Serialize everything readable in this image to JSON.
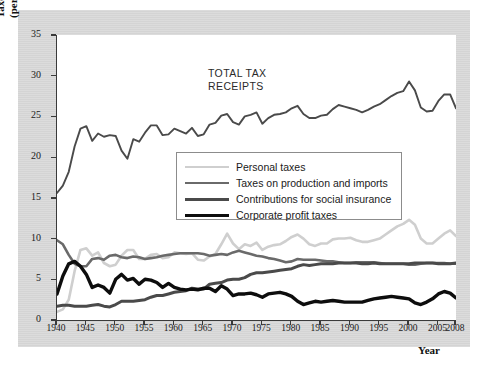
{
  "figure": {
    "annotation_line1": "TOTAL TAX",
    "annotation_line2": "RECEIPTS",
    "ylabel_line1": "Taxes",
    "ylabel_line2": "(percent of GDP)",
    "xlabel": "Year"
  },
  "legend": {
    "items": [
      {
        "label": "Personal taxes",
        "color": "#cfcfcf",
        "width": 2.6
      },
      {
        "label": "Taxes on production and imports",
        "color": "#6a6a6a",
        "width": 2.6
      },
      {
        "label": "Contributions for social insurance",
        "color": "#4a4a4a",
        "width": 3.0
      },
      {
        "label": "Corporate profit taxes",
        "color": "#0d0d0d",
        "width": 3.4
      }
    ]
  },
  "chart_data": {
    "type": "line",
    "title": "",
    "xlabel": "Year",
    "ylabel": "Taxes (percent of GDP)",
    "xlim": [
      1940,
      2008
    ],
    "ylim": [
      0,
      35
    ],
    "yticks": [
      0,
      5,
      10,
      15,
      20,
      25,
      30,
      35
    ],
    "xticks": [
      1940,
      1945,
      1950,
      1955,
      1960,
      1965,
      1970,
      1975,
      1980,
      1985,
      1990,
      1995,
      2000,
      2005,
      2008
    ],
    "grid": false,
    "legend_position": "center",
    "annotations": [
      {
        "text": "TOTAL TAX RECEIPTS",
        "x": 1966,
        "y": 31
      }
    ],
    "x": [
      1940,
      1941,
      1942,
      1943,
      1944,
      1945,
      1946,
      1947,
      1948,
      1949,
      1950,
      1951,
      1952,
      1953,
      1954,
      1955,
      1956,
      1957,
      1958,
      1959,
      1960,
      1961,
      1962,
      1963,
      1964,
      1965,
      1966,
      1967,
      1968,
      1969,
      1970,
      1971,
      1972,
      1973,
      1974,
      1975,
      1976,
      1977,
      1978,
      1979,
      1980,
      1981,
      1982,
      1983,
      1984,
      1985,
      1986,
      1987,
      1988,
      1989,
      1990,
      1991,
      1992,
      1993,
      1994,
      1995,
      1996,
      1997,
      1998,
      1999,
      2000,
      2001,
      2002,
      2003,
      2004,
      2005,
      2006,
      2007,
      2008
    ],
    "series": [
      {
        "name": "Total tax receipts",
        "color": "#4a4a4a",
        "width": 1.9,
        "values": [
          15.6,
          16.5,
          18.2,
          21.3,
          23.5,
          23.8,
          22.0,
          22.9,
          22.5,
          22.7,
          22.6,
          20.8,
          19.8,
          22.2,
          21.9,
          23.0,
          23.9,
          23.9,
          22.7,
          22.8,
          23.5,
          23.2,
          22.9,
          23.6,
          22.6,
          22.8,
          24.0,
          24.2,
          25.1,
          25.3,
          24.3,
          24.0,
          25.0,
          25.2,
          25.5,
          24.1,
          24.8,
          25.2,
          25.3,
          25.5,
          26.0,
          26.3,
          25.3,
          24.8,
          24.8,
          25.1,
          25.2,
          25.9,
          26.4,
          26.2,
          26.0,
          25.8,
          25.5,
          25.8,
          26.2,
          26.5,
          27.0,
          27.5,
          27.9,
          28.1,
          29.3,
          28.2,
          26.1,
          25.6,
          25.7,
          26.9,
          27.7,
          27.7,
          26.0
        ]
      },
      {
        "name": "Personal taxes",
        "color": "#cfcfcf",
        "width": 2.6,
        "values": [
          1.0,
          1.3,
          2.5,
          6.0,
          8.6,
          8.8,
          7.9,
          8.3,
          7.0,
          6.6,
          6.8,
          7.9,
          8.6,
          8.6,
          7.5,
          7.5,
          8.0,
          8.1,
          7.6,
          7.7,
          8.3,
          8.2,
          8.1,
          8.2,
          7.4,
          7.3,
          7.8,
          8.1,
          9.3,
          10.6,
          9.4,
          8.7,
          9.3,
          9.1,
          9.5,
          8.6,
          9.0,
          9.2,
          9.3,
          9.7,
          10.2,
          10.5,
          10.0,
          9.3,
          9.1,
          9.4,
          9.4,
          9.9,
          10.0,
          10.0,
          10.1,
          9.8,
          9.6,
          9.6,
          9.8,
          10.0,
          10.5,
          11.0,
          11.5,
          11.8,
          12.3,
          11.7,
          10.0,
          9.4,
          9.4,
          10.0,
          10.6,
          11.0,
          10.3
        ]
      },
      {
        "name": "Taxes on production and imports",
        "color": "#6a6a6a",
        "width": 2.6,
        "values": [
          9.8,
          9.3,
          8.0,
          6.9,
          6.6,
          6.6,
          7.5,
          7.6,
          7.4,
          7.9,
          8.0,
          7.7,
          7.6,
          7.8,
          7.7,
          7.5,
          7.6,
          7.7,
          7.9,
          8.0,
          8.1,
          8.2,
          8.2,
          8.2,
          8.2,
          8.1,
          7.9,
          8.0,
          8.1,
          8.0,
          8.3,
          8.5,
          8.3,
          8.1,
          7.9,
          7.8,
          7.6,
          7.5,
          7.3,
          7.1,
          7.2,
          7.5,
          7.4,
          7.4,
          7.4,
          7.3,
          7.2,
          7.2,
          7.1,
          7.0,
          7.0,
          7.1,
          7.1,
          7.1,
          7.1,
          7.0,
          6.9,
          6.9,
          6.9,
          6.9,
          6.8,
          6.8,
          6.9,
          7.0,
          7.0,
          7.0,
          7.0,
          6.9,
          6.9
        ]
      },
      {
        "name": "Contributions for social insurance",
        "color": "#4a4a4a",
        "width": 3.0,
        "values": [
          1.7,
          1.8,
          1.8,
          1.7,
          1.7,
          1.7,
          1.8,
          1.9,
          1.7,
          1.6,
          1.9,
          2.3,
          2.3,
          2.3,
          2.4,
          2.5,
          2.8,
          3.0,
          3.0,
          3.2,
          3.4,
          3.5,
          3.6,
          3.9,
          3.8,
          3.8,
          4.4,
          4.5,
          4.6,
          4.9,
          5.0,
          5.0,
          5.2,
          5.6,
          5.8,
          5.8,
          5.9,
          6.0,
          6.1,
          6.2,
          6.3,
          6.6,
          6.8,
          6.7,
          6.8,
          6.9,
          6.9,
          6.9,
          7.0,
          7.0,
          7.0,
          7.0,
          6.9,
          6.9,
          7.0,
          6.9,
          6.9,
          6.9,
          6.9,
          6.9,
          6.9,
          7.0,
          7.0,
          7.0,
          7.0,
          6.9,
          6.9,
          6.9,
          7.0
        ]
      },
      {
        "name": "Corporate profit taxes",
        "color": "#0d0d0d",
        "width": 3.4,
        "values": [
          3.2,
          5.4,
          6.9,
          7.2,
          6.6,
          5.6,
          4.0,
          4.3,
          4.0,
          3.3,
          5.0,
          5.6,
          4.9,
          5.1,
          4.4,
          5.0,
          4.9,
          4.6,
          4.0,
          4.5,
          4.0,
          3.8,
          3.7,
          3.8,
          3.7,
          3.9,
          3.9,
          3.5,
          4.2,
          3.8,
          3.0,
          3.2,
          3.2,
          3.3,
          3.1,
          2.8,
          3.2,
          3.3,
          3.4,
          3.2,
          2.9,
          2.3,
          1.9,
          2.1,
          2.3,
          2.2,
          2.3,
          2.4,
          2.3,
          2.2,
          2.2,
          2.2,
          2.2,
          2.4,
          2.6,
          2.7,
          2.8,
          2.9,
          2.8,
          2.7,
          2.6,
          2.1,
          1.9,
          2.2,
          2.6,
          3.2,
          3.5,
          3.3,
          2.7
        ]
      }
    ]
  }
}
